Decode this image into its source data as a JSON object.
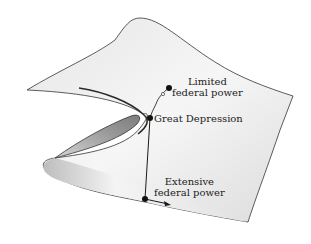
{
  "diagram": {
    "type": "cusp-catastrophe-surface",
    "colors": {
      "surface_light": "#f4f4f4",
      "surface_mid": "#d8d8d8",
      "fold_dark": "#8a8a8a",
      "stroke": "#333333",
      "path": "#1a1a1a"
    },
    "labels": {
      "limited": {
        "line1": "Limited",
        "line2": "federal power"
      },
      "great_depression": "Great Depression",
      "extensive": {
        "line1": "Extensive",
        "line2": "federal power"
      }
    },
    "points": [
      {
        "name": "Limited federal power",
        "x": 169,
        "y": 88
      },
      {
        "name": "Great Depression",
        "x": 150,
        "y": 118
      },
      {
        "name": "Extensive federal power",
        "x": 145,
        "y": 199
      }
    ]
  }
}
